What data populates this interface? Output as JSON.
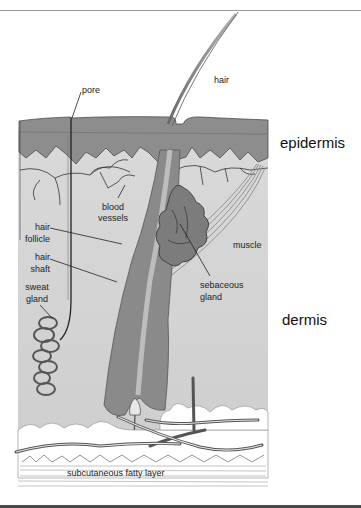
{
  "figure": {
    "layers": [
      {
        "id": "epidermis",
        "label": "epidermis"
      },
      {
        "id": "dermis",
        "label": "dermis"
      },
      {
        "id": "subcutaneous",
        "label": "subcutaneous fatty layer"
      }
    ],
    "labels": {
      "pore": "pore",
      "hair": "hair",
      "blood_vessels_1": "blood",
      "blood_vessels_2": "vessels",
      "hair_follicle_1": "hair",
      "hair_follicle_2": "follicle",
      "hair_shaft_1": "hair",
      "hair_shaft_2": "shaft",
      "sweat_gland_1": "sweat",
      "sweat_gland_2": "gland",
      "muscle": "muscle",
      "sebaceous_gland_1": "sebaceous",
      "sebaceous_gland_2": "gland"
    },
    "colors": {
      "epidermis": "#8f8f8f",
      "dermis": "#d6d6d6",
      "fat": "#ffffff",
      "line": "#2a2a2a",
      "follicle": "#7a7a7a"
    }
  }
}
